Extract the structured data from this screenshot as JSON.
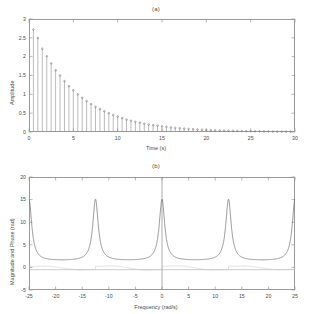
{
  "figure": {
    "background": "#ffffff",
    "line_color": "#6f6f6f",
    "axis_color": "#9a9a9a"
  },
  "panel_a": {
    "title": "(a)",
    "xlabel": "Time (s)",
    "ylabel": "Amplitude"
  },
  "panel_b": {
    "title": "(b)",
    "xlabel": "Frequency (rad/s)",
    "ylabel": "Magnitude and Phase (rad)"
  },
  "chart_data": [
    {
      "type": "bar",
      "title": "(a)",
      "xlabel": "Time (s)",
      "ylabel": "Amplitude",
      "xlim": [
        0,
        30
      ],
      "ylim": [
        0,
        3
      ],
      "xticks": [
        0,
        5,
        10,
        15,
        20,
        25,
        30
      ],
      "xticklabels": [
        "0",
        "5",
        "10",
        "15",
        "20",
        "25",
        "30"
      ],
      "yticks": [
        0,
        0.5,
        1,
        1.5,
        2,
        2.5,
        3
      ],
      "yticklabels": [
        "0",
        "0.5",
        "1",
        "1.5",
        "2",
        "2.5",
        "3"
      ],
      "grid": false,
      "legend": null,
      "style": "stem",
      "series": [
        {
          "name": "damped exponential samples",
          "x": [
            0.5,
            1.0,
            1.5,
            2.0,
            2.5,
            3.0,
            3.5,
            4.0,
            4.5,
            5.0,
            5.5,
            6.0,
            6.5,
            7.0,
            7.5,
            8.0,
            8.5,
            9.0,
            9.5,
            10.0,
            10.5,
            11.0,
            11.5,
            12.0,
            12.5,
            13.0,
            13.5,
            14.0,
            14.5,
            15.0,
            15.5,
            16.0,
            16.5,
            17.0,
            17.5,
            18.0,
            18.5,
            19.0,
            19.5,
            20.0,
            20.5,
            21.0,
            21.5,
            22.0,
            22.5,
            23.0,
            23.5,
            24.0,
            24.5,
            25.0,
            25.5,
            26.0,
            26.5,
            27.0,
            27.5,
            28.0,
            28.5,
            29.0,
            29.5
          ],
          "values": [
            2.72,
            2.5,
            2.21,
            2.01,
            1.82,
            1.64,
            1.5,
            1.35,
            1.22,
            1.11,
            1.0,
            0.91,
            0.82,
            0.74,
            0.67,
            0.61,
            0.55,
            0.5,
            0.45,
            0.41,
            0.37,
            0.33,
            0.3,
            0.27,
            0.25,
            0.22,
            0.2,
            0.18,
            0.17,
            0.15,
            0.14,
            0.12,
            0.11,
            0.1,
            0.09,
            0.08,
            0.075,
            0.068,
            0.061,
            0.055,
            0.05,
            0.045,
            0.041,
            0.037,
            0.034,
            0.03,
            0.027,
            0.025,
            0.022,
            0.02,
            0.018,
            0.017,
            0.015,
            0.014,
            0.012,
            0.011,
            0.01,
            0.009,
            0.008
          ]
        }
      ]
    },
    {
      "type": "line",
      "title": "(b)",
      "xlabel": "Frequency (rad/s)",
      "ylabel": "Magnitude and Phase (rad)",
      "xlim": [
        -25,
        25
      ],
      "ylim": [
        -5,
        20
      ],
      "xticks": [
        -25,
        -20,
        -15,
        -10,
        -5,
        0,
        5,
        10,
        15,
        20,
        25
      ],
      "xticklabels": [
        "-25",
        "-20",
        "-15",
        "-10",
        "-5",
        "0",
        "5",
        "10",
        "15",
        "20",
        "25"
      ],
      "yticks": [
        -5,
        0,
        5,
        10,
        15,
        20
      ],
      "yticklabels": [
        "-5",
        "0",
        "5",
        "10",
        "15",
        "20"
      ],
      "grid": false,
      "legend": null,
      "series": [
        {
          "name": "Magnitude",
          "peaks_at": [
            -25,
            -12.5,
            0,
            12.5,
            25
          ],
          "peak_value": 15,
          "baseline_value": 1.4
        },
        {
          "name": "Phase",
          "oscillation_range": [
            -0.8,
            0.5
          ],
          "baseline_value": -0.5
        }
      ]
    }
  ]
}
